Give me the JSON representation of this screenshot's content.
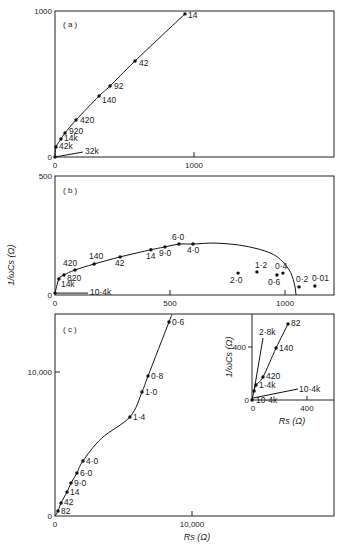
{
  "chart_data": [
    {
      "type": "line",
      "panel": "(a)",
      "xlabel": "",
      "ylabel": "",
      "xlim": [
        0,
        2000
      ],
      "ylim": [
        0,
        1000
      ],
      "x_ticks": [
        "0",
        "1000"
      ],
      "y_ticks": [
        "0",
        "1000"
      ],
      "grid": false,
      "series": [
        {
          "name": "impedance locus (a)",
          "points": [
            {
              "label": "32k",
              "x": 0,
              "y": 0
            },
            {
              "label": "42k",
              "x": 7,
              "y": 68
            },
            {
              "label": "14k",
              "x": 43,
              "y": 123
            },
            {
              "label": "920",
              "x": 72,
              "y": 164
            },
            {
              "label": "420",
              "x": 151,
              "y": 253
            },
            {
              "label": "140",
              "x": 317,
              "y": 418
            },
            {
              "label": "92",
              "x": 396,
              "y": 486
            },
            {
              "label": "42",
              "x": 576,
              "y": 658
            },
            {
              "label": "14",
              "x": 935,
              "y": 980
            }
          ]
        }
      ]
    },
    {
      "type": "scatter",
      "panel": "(b)",
      "xlabel": "",
      "ylabel": "1/ωCs (Ω)",
      "xlim": [
        0,
        1220
      ],
      "ylim": [
        0,
        500
      ],
      "x_ticks": [
        "0",
        "500",
        "1000"
      ],
      "y_ticks": [
        "0",
        "500"
      ],
      "grid": false,
      "series": [
        {
          "name": "on curve",
          "points": [
            {
              "label": "10·4k",
              "x": 0,
              "y": 8
            },
            {
              "label": "14k",
              "x": 17,
              "y": 67
            },
            {
              "label": "820",
              "x": 39,
              "y": 84
            },
            {
              "label": "420",
              "x": 87,
              "y": 105
            },
            {
              "label": "140",
              "x": 170,
              "y": 130
            },
            {
              "label": "42",
              "x": 283,
              "y": 160
            },
            {
              "label": "14",
              "x": 417,
              "y": 190
            },
            {
              "label": "9·0",
              "x": 478,
              "y": 202
            },
            {
              "label": "6·0",
              "x": 539,
              "y": 214
            },
            {
              "label": "4·0",
              "x": 600,
              "y": 214
            }
          ]
        },
        {
          "name": "off curve",
          "points": [
            {
              "label": "2·0",
              "x": 796,
              "y": 92
            },
            {
              "label": "1·2",
              "x": 878,
              "y": 97
            },
            {
              "label": "0·6",
              "x": 965,
              "y": 84
            },
            {
              "label": "0·4",
              "x": 991,
              "y": 92
            },
            {
              "label": "0·2",
              "x": 1061,
              "y": 34
            },
            {
              "label": "0·01",
              "x": 1130,
              "y": 38
            }
          ]
        }
      ]
    },
    {
      "type": "line",
      "panel": "(c)",
      "xlabel": "Rs (Ω)",
      "ylabel": "",
      "xlim": [
        0,
        20500
      ],
      "ylim": [
        0,
        14000
      ],
      "x_ticks": [
        "0",
        "10,000"
      ],
      "y_ticks": [
        "0",
        "10,000"
      ],
      "grid": false,
      "series": [
        {
          "name": "impedance locus (c)",
          "points": [
            {
              "label": "82",
              "x": 220,
              "y": 350
            },
            {
              "label": "42",
              "x": 440,
              "y": 900
            },
            {
              "label": "14",
              "x": 880,
              "y": 1670
            },
            {
              "label": "9·0",
              "x": 1170,
              "y": 2290
            },
            {
              "label": "6·0",
              "x": 1600,
              "y": 2990
            },
            {
              "label": "4·0",
              "x": 2040,
              "y": 3820
            },
            {
              "label": "1·4",
              "x": 5470,
              "y": 6880
            },
            {
              "label": "1·0",
              "x": 6350,
              "y": 8610
            },
            {
              "label": "0·8",
              "x": 6790,
              "y": 9720
            },
            {
              "label": "0·6",
              "x": 8320,
              "y": 13470
            }
          ]
        }
      ]
    },
    {
      "type": "line",
      "panel": "(c) inset",
      "xlabel": "Rs (Ω)",
      "ylabel": "1/ωCs (Ω)",
      "xlim": [
        0,
        600
      ],
      "ylim": [
        0,
        650
      ],
      "x_ticks": [
        "0",
        "400"
      ],
      "y_ticks": [
        "0",
        "400"
      ],
      "grid": false,
      "series": [
        {
          "name": "inset locus",
          "points": [
            {
              "label": "10·4k",
              "x": 0,
              "y": 0
            },
            {
              "label": "",
              "x": 15,
              "y": 68
            },
            {
              "label": "1·4k",
              "x": 29,
              "y": 113
            },
            {
              "label": "420",
              "x": 80,
              "y": 174
            },
            {
              "label": "140",
              "x": 175,
              "y": 392
            },
            {
              "label": "82",
              "x": 262,
              "y": 574
            }
          ],
          "callouts": [
            "2·8k",
            "10·4k"
          ]
        }
      ]
    }
  ],
  "panels": {
    "a": {
      "tag": "( a )",
      "y_top": "1000",
      "y_zero": "0",
      "x_zero": "0",
      "x_tick": "1000"
    },
    "b": {
      "tag": "( b )",
      "y_top": "500",
      "y_zero": "0",
      "x_zero": "0",
      "x_tick1": "500",
      "x_tick2": "1000",
      "ylabel": "1/ωCs (Ω)"
    },
    "c": {
      "tag": "( c )",
      "y_tick": "10,000",
      "y_zero": "0",
      "x_zero": "0",
      "x_tick": "10,000",
      "xlabel": "Rs (Ω)"
    },
    "inset": {
      "y_tick": "400",
      "y_zero": "0",
      "x_zero": "0",
      "x_tick": "400",
      "xlabel": "Rs (Ω)",
      "ylabel": "1/ωCs (Ω)",
      "callout_28k": "2·8k",
      "callout_104k": "10·4k"
    }
  }
}
